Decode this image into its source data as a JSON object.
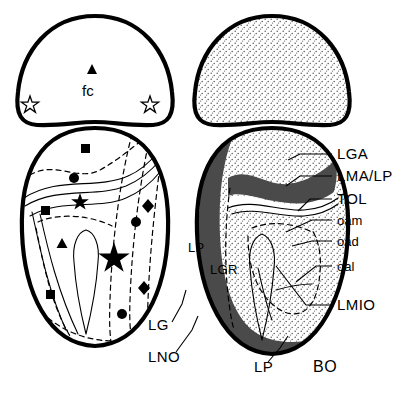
{
  "figure": {
    "panel_label": "BO",
    "left_panel": {
      "name": "symbol-map-panel",
      "top_region_label": "fc",
      "symbols": [
        {
          "id": "tri-fc",
          "shape": "triangle",
          "fill": "solid",
          "x": 92,
          "y": 70,
          "size": 7
        },
        {
          "id": "star-open-left",
          "shape": "star",
          "fill": "open",
          "x": 30,
          "y": 104,
          "size": 9
        },
        {
          "id": "star-open-right",
          "shape": "star",
          "fill": "open",
          "x": 150,
          "y": 104,
          "size": 9
        },
        {
          "id": "sq-1",
          "shape": "square",
          "fill": "solid",
          "x": 85,
          "y": 148,
          "size": 8
        },
        {
          "id": "circ-1",
          "shape": "circle",
          "fill": "solid",
          "x": 74,
          "y": 178,
          "size": 8
        },
        {
          "id": "star-2",
          "shape": "star",
          "fill": "solid",
          "x": 80,
          "y": 200,
          "size": 9
        },
        {
          "id": "sq-2",
          "shape": "square",
          "fill": "solid",
          "x": 45,
          "y": 210,
          "size": 8
        },
        {
          "id": "diam-1",
          "shape": "diamond",
          "fill": "solid",
          "x": 148,
          "y": 206,
          "size": 9
        },
        {
          "id": "circ-2",
          "shape": "circle",
          "fill": "solid",
          "x": 136,
          "y": 222,
          "size": 8
        },
        {
          "id": "tri-2",
          "shape": "triangle",
          "fill": "solid",
          "x": 62,
          "y": 245,
          "size": 8
        },
        {
          "id": "star-big",
          "shape": "star",
          "fill": "solid",
          "x": 114,
          "y": 256,
          "size": 15
        },
        {
          "id": "sq-3",
          "shape": "square",
          "fill": "solid",
          "x": 50,
          "y": 294,
          "size": 8
        },
        {
          "id": "diam-2",
          "shape": "diamond",
          "fill": "solid",
          "x": 144,
          "y": 288,
          "size": 9
        },
        {
          "id": "circ-3",
          "shape": "circle",
          "fill": "solid",
          "x": 122,
          "y": 314,
          "size": 8
        }
      ]
    },
    "right_panel": {
      "name": "shaded-anatomy-panel",
      "inner_labels": [
        {
          "id": "lp-inner",
          "text": "LP",
          "x": 192,
          "y": 248
        },
        {
          "id": "lgr-inner",
          "text": "LGR",
          "x": 214,
          "y": 270
        }
      ]
    },
    "callouts": [
      {
        "id": "lga",
        "text": "LGA",
        "x": 337,
        "y": 158
      },
      {
        "id": "lma-lp",
        "text": "LMA/LP",
        "x": 337,
        "y": 180
      },
      {
        "id": "tol",
        "text": "TOL",
        "x": 337,
        "y": 203
      },
      {
        "id": "oam",
        "text": "oam",
        "x": 337,
        "y": 224
      },
      {
        "id": "oad",
        "text": "oad",
        "x": 337,
        "y": 245
      },
      {
        "id": "oal",
        "text": "oal",
        "x": 337,
        "y": 270
      },
      {
        "id": "lmio",
        "text": "LMIO",
        "x": 337,
        "y": 309
      }
    ],
    "lower_callouts": [
      {
        "id": "lg",
        "text": "LG",
        "x": 152,
        "y": 328
      },
      {
        "id": "lno",
        "text": "LNO",
        "x": 152,
        "y": 360
      },
      {
        "id": "lp-bottom",
        "text": "LP",
        "x": 258,
        "y": 370
      }
    ],
    "colors": {
      "outline": "#000000",
      "dark_band": "#4a4a4a",
      "stipple_light": "#e9e9e9",
      "stipple_mid": "#dedede",
      "hatch_band": "#b8b8b8",
      "background": "#ffffff"
    }
  }
}
